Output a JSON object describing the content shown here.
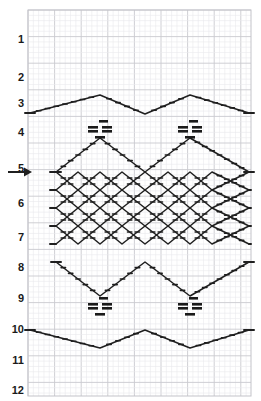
{
  "chart_data": {
    "type": "table",
    "xlabel": "",
    "ylabel": "Row",
    "grid": true,
    "grid_columns": 42,
    "grid_rows": 73,
    "row_labels": [
      "1",
      "2",
      "3",
      "4",
      "5",
      "6",
      "7",
      "8",
      "9",
      "10",
      "11",
      "12"
    ],
    "row_label_y": [
      40,
      78,
      104,
      133,
      169,
      204,
      238,
      268,
      299,
      330,
      361,
      391
    ],
    "legend_position": "none",
    "annotations": [
      {
        "name": "start-arrow",
        "label": "",
        "row": "5",
        "x": 30,
        "y": 172
      }
    ],
    "symbols": [
      {
        "name": "purl-cluster",
        "glyph": "=",
        "x": 100,
        "y": 129
      },
      {
        "name": "purl-cluster",
        "glyph": "=",
        "x": 190,
        "y": 129
      },
      {
        "name": "purl-cluster",
        "glyph": "=",
        "x": 100,
        "y": 306
      },
      {
        "name": "purl-cluster",
        "glyph": "=",
        "x": 190,
        "y": 306
      }
    ],
    "series": [
      {
        "name": "top-zigzag",
        "values": [
          113,
          95,
          123,
          95,
          113
        ]
      },
      {
        "name": "upper-cable-v",
        "values": [
          138,
          172,
          138,
          172,
          138
        ]
      },
      {
        "name": "lattice-band-1",
        "values": [
          172,
          190,
          172,
          190,
          172
        ]
      },
      {
        "name": "lattice-band-2",
        "values": [
          190,
          208,
          190,
          208,
          190
        ]
      },
      {
        "name": "lattice-band-3",
        "values": [
          208,
          226,
          208,
          226,
          208
        ]
      },
      {
        "name": "lattice-band-4",
        "values": [
          226,
          244,
          226,
          244,
          226
        ]
      },
      {
        "name": "lower-cable-v",
        "values": [
          262,
          296,
          262,
          296,
          262
        ]
      },
      {
        "name": "bottom-zigzag",
        "values": [
          330,
          348,
          330,
          348,
          330
        ]
      }
    ]
  },
  "grid": {
    "left": 28,
    "top": 10,
    "right": 251,
    "bottom": 396,
    "cell": 5.32,
    "minor_color": "#e9e9ec",
    "major_color": "#c9c9cf",
    "border_color": "#c3c3c9"
  },
  "style": {
    "line_color": "#1f1f1f",
    "number_color": "#1a1a1a",
    "symbol_color": "#1a1a1a",
    "background": "#ffffff"
  }
}
